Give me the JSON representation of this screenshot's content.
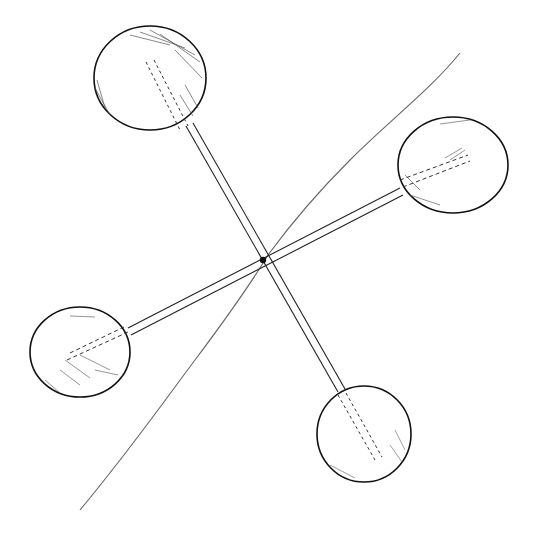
{
  "drawing": {
    "description": "Pen-and-ink sketch of four spheres on two crossed rods with a diagonal line through the crossing point",
    "stroke_color": "#1a1a1a",
    "line_color": "#555555",
    "background": "#ffffff",
    "center": {
      "x": 263,
      "y": 260
    },
    "diagonal_line": {
      "x1": 460,
      "y1": 53,
      "x2": 80,
      "y2": 510
    },
    "spheres": [
      {
        "name": "top",
        "cx": 150,
        "cy": 78,
        "rx": 56,
        "ry": 52
      },
      {
        "name": "right",
        "cx": 453,
        "cy": 165,
        "rx": 55,
        "ry": 48
      },
      {
        "name": "left",
        "cx": 80,
        "cy": 352,
        "rx": 50,
        "ry": 45
      },
      {
        "name": "bottom",
        "cx": 364,
        "cy": 434,
        "rx": 47,
        "ry": 48
      }
    ]
  }
}
